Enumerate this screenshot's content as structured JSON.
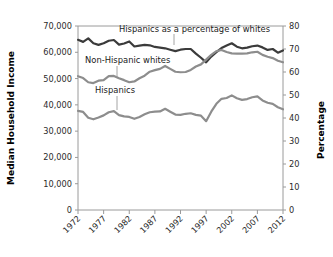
{
  "chart_data": {
    "type": "line",
    "title": "",
    "xlabel": "",
    "ylabel": "Median Household Income",
    "y2label": "Percentage",
    "grid": false,
    "legend_position": "inline-annotations",
    "x": [
      1972,
      1973,
      1974,
      1975,
      1976,
      1977,
      1978,
      1979,
      1980,
      1981,
      1982,
      1983,
      1984,
      1985,
      1986,
      1987,
      1988,
      1989,
      1990,
      1991,
      1992,
      1993,
      1994,
      1995,
      1996,
      1997,
      1998,
      1999,
      2000,
      2001,
      2002,
      2003,
      2004,
      2005,
      2006,
      2007,
      2008,
      2009,
      2010,
      2011,
      2012
    ],
    "xticks": [
      1972,
      1977,
      1982,
      1987,
      1992,
      1997,
      2002,
      2007,
      2012
    ],
    "xlim": [
      1972,
      2012
    ],
    "ylim": [
      0,
      70000
    ],
    "yticks": [
      0,
      10000,
      20000,
      30000,
      40000,
      50000,
      60000,
      70000
    ],
    "ytick_labels": [
      "0",
      "10,000",
      "20,000",
      "30,000",
      "40,000",
      "50,000",
      "60,000",
      "70,000"
    ],
    "y2lim": [
      0,
      80
    ],
    "y2ticks": [
      0,
      10,
      20,
      30,
      40,
      50,
      60,
      70,
      80
    ],
    "y2tick_labels": [
      "0",
      "10",
      "20",
      "30",
      "40",
      "50",
      "60",
      "70",
      "80"
    ],
    "series": [
      {
        "name": "Hispanics as a percentage of whites",
        "axis": "right",
        "color": "#3b3b3b",
        "width": 2.2,
        "values": [
          74.0,
          73.1,
          74.6,
          72.5,
          71.8,
          72.5,
          73.6,
          73.9,
          71.9,
          72.4,
          73.3,
          71.1,
          71.5,
          71.8,
          71.6,
          70.9,
          70.6,
          70.3,
          69.7,
          69.1,
          69.7,
          70.0,
          70.0,
          68.0,
          66.2,
          64.2,
          66.7,
          68.6,
          70.4,
          71.5,
          72.5,
          71.0,
          70.3,
          70.6,
          71.2,
          71.5,
          70.7,
          69.6,
          70.0,
          68.4,
          69.4
        ]
      },
      {
        "name": "Non-Hispanic whites",
        "axis": "left",
        "color": "#8d8d8d",
        "width": 2.2,
        "values": [
          50900,
          50200,
          48600,
          48300,
          49200,
          49400,
          50900,
          51000,
          50100,
          49400,
          48600,
          48900,
          50100,
          51100,
          52600,
          53200,
          53700,
          54800,
          53700,
          52600,
          52400,
          52500,
          53300,
          54600,
          55400,
          57200,
          59000,
          60400,
          60900,
          60100,
          59600,
          59500,
          59500,
          59600,
          60000,
          60200,
          59000,
          58300,
          57800,
          56800,
          56200
        ]
      },
      {
        "name": "Hispanics",
        "axis": "left",
        "color": "#8d8d8d",
        "width": 2.2,
        "values": [
          37700,
          37300,
          35100,
          34500,
          35200,
          36000,
          37200,
          37600,
          36100,
          35600,
          35400,
          34700,
          35400,
          36400,
          37200,
          37400,
          37500,
          38500,
          37400,
          36300,
          36200,
          36600,
          36800,
          36200,
          35900,
          33800,
          37400,
          40400,
          42300,
          42600,
          43600,
          42500,
          41900,
          42200,
          42900,
          43200,
          41700,
          40800,
          40400,
          39100,
          38300
        ]
      }
    ],
    "annotations": [
      {
        "text": "Hispanics as a percentage of whites",
        "x_px": 119,
        "y_px": 32,
        "leader_x": 174,
        "leader_y1": 34,
        "leader_y2": 45
      },
      {
        "text": "Non-Hispanic whites",
        "x_px": 85,
        "y_px": 63,
        "leader_x": 117,
        "leader_y1": 66,
        "leader_y2": 77
      },
      {
        "text": "Hispanics",
        "x_px": 95,
        "y_px": 93,
        "leader_x": 117,
        "leader_y1": 96,
        "leader_y2": 110
      }
    ]
  },
  "axes": {
    "left_title": "Median Household Income",
    "right_title": "Percentage"
  }
}
